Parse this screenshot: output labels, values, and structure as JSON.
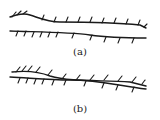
{
  "figure": {
    "panels": [
      {
        "id": "a",
        "label": "(a)",
        "label_pos": [
          80,
          47
        ],
        "upper_line": "M10,17 C18,14 24,13 30,15 C42,19 48,22 60,22 C90,22 120,23 140,25 L146,28",
        "upper_ticks": [
          [
            12,
            17,
            16,
            12
          ],
          [
            17,
            15,
            21,
            11
          ],
          [
            23,
            14,
            27,
            11
          ],
          [
            42,
            20,
            44,
            15
          ],
          [
            54,
            22,
            56,
            17
          ],
          [
            66,
            22,
            68,
            17
          ],
          [
            78,
            22,
            80,
            17
          ],
          [
            90,
            22,
            92,
            17
          ],
          [
            102,
            23,
            104,
            18
          ],
          [
            114,
            23,
            116,
            18
          ],
          [
            126,
            24,
            128,
            19
          ],
          [
            138,
            25,
            140,
            20
          ],
          [
            144,
            27,
            147,
            24
          ]
        ],
        "lower_line": "M10,31 C40,32 70,32 90,35 C110,38 130,38 146,38",
        "lower_ticks": [
          [
            18,
            31,
            16,
            36
          ],
          [
            26,
            31,
            24,
            36
          ],
          [
            34,
            32,
            32,
            37
          ],
          [
            42,
            32,
            40,
            37
          ],
          [
            50,
            32,
            48,
            37
          ],
          [
            58,
            32,
            56,
            37
          ],
          [
            74,
            33,
            72,
            38
          ],
          [
            92,
            35,
            90,
            40
          ],
          [
            106,
            37,
            104,
            42
          ],
          [
            120,
            38,
            118,
            43
          ],
          [
            134,
            38,
            132,
            43
          ]
        ]
      },
      {
        "id": "b",
        "label": "(b)",
        "label_pos": [
          80,
          104
        ],
        "upper_line": "M12,72 C30,70 40,72 50,76 C70,82 100,80 130,82 L146,86",
        "upper_ticks": [
          [
            16,
            72,
            20,
            67
          ],
          [
            22,
            71,
            26,
            66
          ],
          [
            28,
            71,
            32,
            66
          ],
          [
            36,
            72,
            40,
            67
          ],
          [
            48,
            75,
            52,
            70
          ],
          [
            62,
            79,
            66,
            74
          ],
          [
            76,
            80,
            80,
            75
          ],
          [
            90,
            80,
            94,
            75
          ],
          [
            104,
            80,
            108,
            75
          ],
          [
            118,
            81,
            122,
            76
          ],
          [
            132,
            82,
            136,
            77
          ],
          [
            142,
            84,
            145,
            80
          ]
        ],
        "lower_line": "M10,77 C30,78 50,80 70,80 C100,80 120,86 146,89",
        "lower_ticks": [
          [
            20,
            78,
            18,
            83
          ],
          [
            28,
            78,
            26,
            83
          ],
          [
            36,
            79,
            34,
            84
          ],
          [
            44,
            79,
            42,
            84
          ],
          [
            54,
            80,
            52,
            85
          ],
          [
            66,
            80,
            64,
            85
          ],
          [
            86,
            81,
            84,
            86
          ],
          [
            104,
            83,
            102,
            88
          ],
          [
            118,
            85,
            116,
            90
          ],
          [
            134,
            87,
            132,
            92
          ]
        ]
      }
    ]
  }
}
